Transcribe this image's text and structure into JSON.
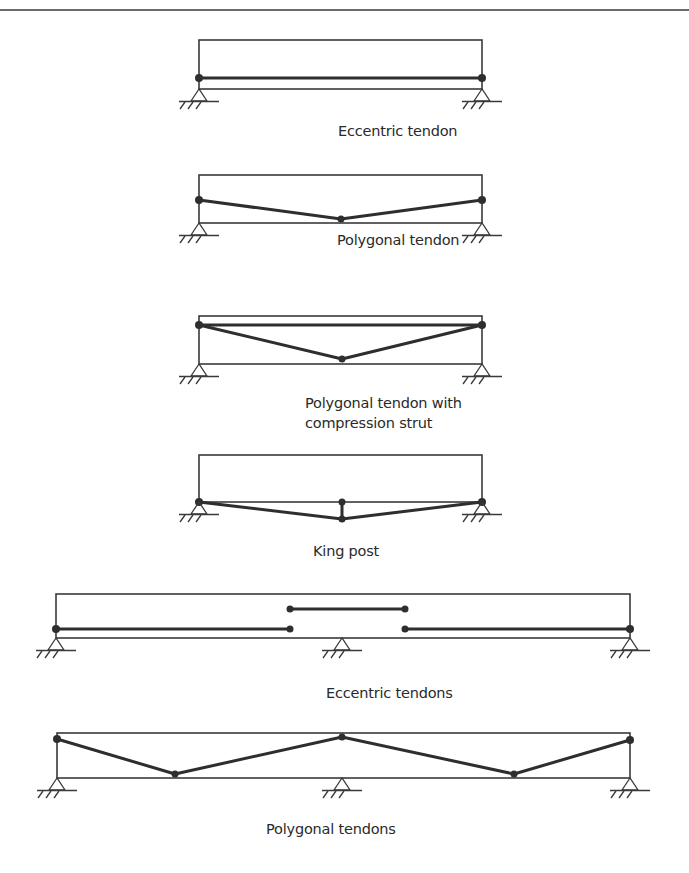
{
  "figure": {
    "colors": {
      "line": "#3a3a3a",
      "tendon": "#2e2e2e",
      "background": "#ffffff"
    },
    "panels": [
      {
        "id": "eccentric-tendon",
        "label": "Eccentric tendon"
      },
      {
        "id": "polygonal-tendon",
        "label": "Polygonal tendon"
      },
      {
        "id": "polygonal-tendon-strut",
        "label_line1": "Polygonal tendon with",
        "label_line2": "compression strut"
      },
      {
        "id": "king-post",
        "label": "King post"
      },
      {
        "id": "eccentric-tendons",
        "label": "Eccentric tendons"
      },
      {
        "id": "polygonal-tendons",
        "label": "Polygonal tendons"
      }
    ]
  }
}
